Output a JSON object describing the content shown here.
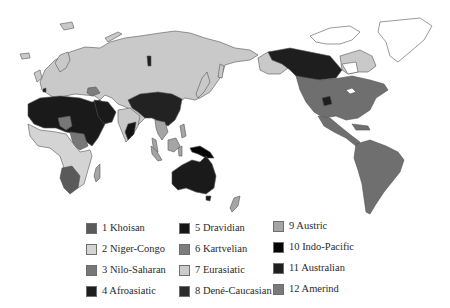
{
  "map": {
    "title": "World language families",
    "colors": {
      "khoisan": "#5a5a5a",
      "niger_congo": "#cfcfcf",
      "nilo_saharan": "#777777",
      "afroasiatic": "#1a1a1a",
      "dravidian": "#141414",
      "kartvelian": "#7d7d7d",
      "eurasiatic": "#c9c9c9",
      "dene_caucasian": "#2a2a2a",
      "austric": "#a8a8a8",
      "indo_pacific": "#050505",
      "australian": "#1c1c1c",
      "amerind": "#6f6f6f",
      "unclassified_white": "#ffffff",
      "coastline": "#555555"
    }
  },
  "legend": {
    "items": [
      {
        "label": "1 Khoisan",
        "color": "#5a5a5a"
      },
      {
        "label": "2 Niger-Congo",
        "color": "#d4d4d4"
      },
      {
        "label": "3 Nilo-Saharan",
        "color": "#777777"
      },
      {
        "label": "4 Afroasiatic",
        "color": "#1e1e1e"
      },
      {
        "label": "5 Dravidian",
        "color": "#151515"
      },
      {
        "label": "6 Kartvelian",
        "color": "#7d7d7d"
      },
      {
        "label": "7 Eurasiatic",
        "color": "#cccccc"
      },
      {
        "label": "8 Dené-Caucasian",
        "color": "#2b2b2b"
      },
      {
        "label": "9 Austric",
        "color": "#a5a5a5"
      },
      {
        "label": "10 Indo-Pacific",
        "color": "#050505"
      },
      {
        "label": "11 Australian",
        "color": "#1f1f1f"
      },
      {
        "label": "12 Amerind",
        "color": "#7a7a7a"
      }
    ]
  }
}
